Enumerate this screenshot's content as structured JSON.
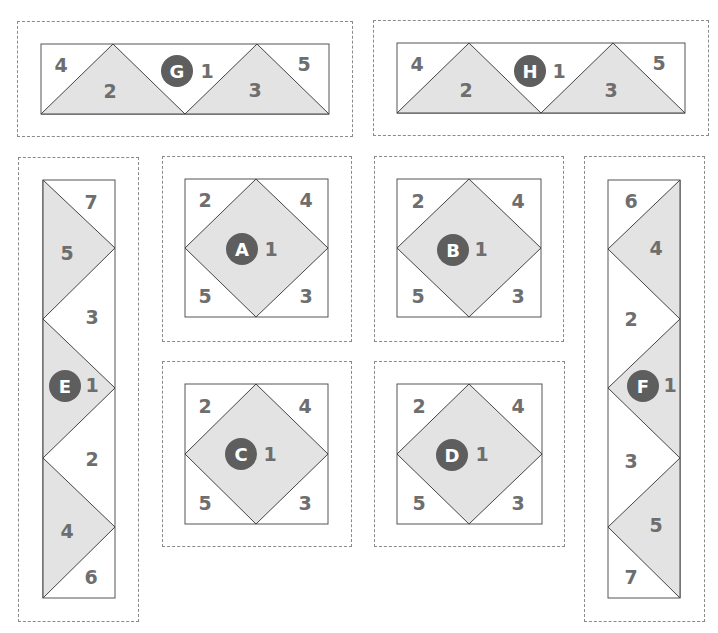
{
  "colors": {
    "fill": "#e3e3e3",
    "outline": "#555555",
    "number": "#6e6e6e",
    "badge": "#5e5e5e",
    "dashed_border": "#8a8a8a"
  },
  "blocks": {
    "G": {
      "label": "G",
      "pieces": [
        "1",
        "2",
        "3",
        "4",
        "5"
      ],
      "type": "flying-geese-horizontal"
    },
    "H": {
      "label": "H",
      "pieces": [
        "1",
        "2",
        "3",
        "4",
        "5"
      ],
      "type": "flying-geese-horizontal"
    },
    "A": {
      "label": "A",
      "pieces": [
        "1",
        "2",
        "3",
        "4",
        "5"
      ],
      "type": "square-in-square"
    },
    "B": {
      "label": "B",
      "pieces": [
        "1",
        "2",
        "3",
        "4",
        "5"
      ],
      "type": "square-in-square"
    },
    "C": {
      "label": "C",
      "pieces": [
        "1",
        "2",
        "3",
        "4",
        "5"
      ],
      "type": "square-in-square"
    },
    "D": {
      "label": "D",
      "pieces": [
        "1",
        "2",
        "3",
        "4",
        "5"
      ],
      "type": "square-in-square"
    },
    "E": {
      "label": "E",
      "pieces": [
        "7",
        "5",
        "3",
        "1",
        "2",
        "4",
        "6"
      ],
      "type": "vertical-strip"
    },
    "F": {
      "label": "F",
      "pieces": [
        "6",
        "4",
        "2",
        "1",
        "3",
        "5",
        "7"
      ],
      "type": "vertical-strip"
    }
  }
}
